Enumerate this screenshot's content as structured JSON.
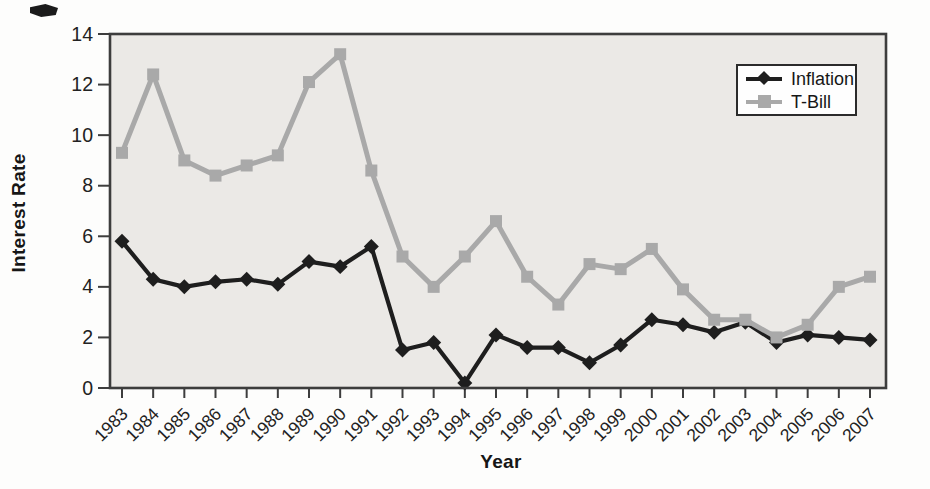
{
  "chart_data": {
    "type": "line",
    "title": "",
    "xlabel": "Year",
    "ylabel": "Interest Rate",
    "categories": [
      "1983",
      "1984",
      "1985",
      "1986",
      "1987",
      "1988",
      "1989",
      "1990",
      "1991",
      "1992",
      "1993",
      "1994",
      "1995",
      "1996",
      "1997",
      "1998",
      "1999",
      "2000",
      "2001",
      "2002",
      "2003",
      "2004",
      "2005",
      "2006",
      "2007"
    ],
    "series": [
      {
        "name": "Inflation",
        "marker": "diamond",
        "color": "#1e1e1e",
        "values": [
          5.8,
          4.3,
          4.0,
          4.2,
          4.3,
          4.1,
          5.0,
          4.8,
          5.6,
          1.5,
          1.8,
          0.2,
          2.1,
          1.6,
          1.6,
          1.0,
          1.7,
          2.7,
          2.5,
          2.2,
          2.6,
          1.8,
          2.1,
          2.0,
          1.9
        ]
      },
      {
        "name": "T-Bill",
        "marker": "square",
        "color": "#a9a9a9",
        "values": [
          9.3,
          12.4,
          9.0,
          8.4,
          8.8,
          9.2,
          12.1,
          13.2,
          8.6,
          5.2,
          4.0,
          5.2,
          6.6,
          4.4,
          3.3,
          4.9,
          4.7,
          5.5,
          3.9,
          2.7,
          2.7,
          2.0,
          2.5,
          4.0,
          4.4
        ]
      }
    ],
    "ylim": [
      0,
      14
    ],
    "y_ticks": [
      0,
      2,
      4,
      6,
      8,
      10,
      12,
      14
    ],
    "grid": false,
    "legend_position": "top-right",
    "plot_bg": "#ebe9e6",
    "axis_color": "#3d3d3d",
    "tick_label_color": "#222222"
  }
}
